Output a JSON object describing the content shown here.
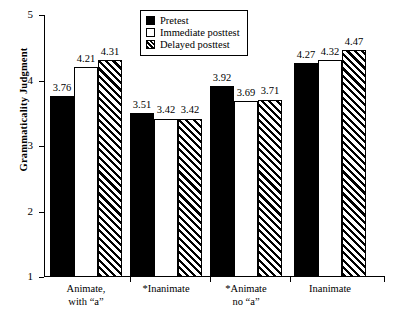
{
  "chart_data": {
    "type": "bar",
    "title": "",
    "subtitle": "",
    "xlabel": "",
    "ylabel": "Grammaticality Judgment",
    "ylim": [
      1,
      5
    ],
    "yticks": [
      1,
      2,
      3,
      4,
      5
    ],
    "ytick_labels": [
      "1",
      "2",
      "3",
      "4",
      "5"
    ],
    "grid": false,
    "legend_position": "top-center",
    "categories": [
      "Animate, with “a”",
      "*Inanimate",
      "*Animate no “a”",
      "Inanimate"
    ],
    "category_lines": [
      [
        "Animate,",
        "with “a”"
      ],
      [
        "*Inanimate"
      ],
      [
        "*Animate",
        "no “a”"
      ],
      [
        "Inanimate"
      ]
    ],
    "series": [
      {
        "name": "Pretest",
        "fill": "solid-black",
        "values": [
          3.76,
          3.51,
          3.92,
          4.27
        ],
        "labels": [
          "3.76",
          "3.51",
          "3.92",
          "4.27"
        ]
      },
      {
        "name": "Immediate posttest",
        "fill": "white",
        "values": [
          4.21,
          3.42,
          3.69,
          4.32
        ],
        "labels": [
          "4.21",
          "3.42",
          "3.69",
          "4.32"
        ]
      },
      {
        "name": "Delayed posttest",
        "fill": "diagonal-hatch",
        "values": [
          4.31,
          3.42,
          3.71,
          4.47
        ],
        "labels": [
          "4.31",
          "3.42",
          "3.71",
          "4.47"
        ]
      }
    ]
  },
  "legend": {
    "items": [
      {
        "label": "Pretest",
        "swatch": "solid-black-swatch"
      },
      {
        "label": "Immediate posttest",
        "swatch": "white-swatch"
      },
      {
        "label": "Delayed posttest",
        "swatch": "hatched-swatch"
      }
    ]
  },
  "colors": {
    "bar_fill": "#000000",
    "bar_empty": "#ffffff",
    "axis": "#000000",
    "background": "#ffffff"
  }
}
